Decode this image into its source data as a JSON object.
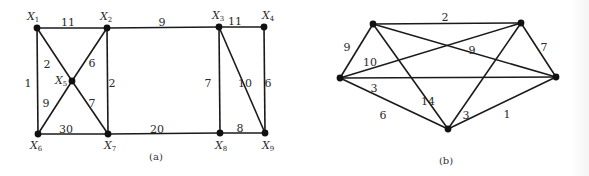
{
  "colors": {
    "edge": "#1a1a1a",
    "node": "#111111",
    "text": "#2a2a2a",
    "background": "#ffffff"
  },
  "graphs": [
    {
      "id": "a",
      "caption": "(a)",
      "caption_pos": [
        156,
        160
      ],
      "nodes": [
        {
          "id": "X1",
          "base": "X",
          "sub": "1",
          "x": 37,
          "y": 28,
          "lx": 27,
          "ly": 20
        },
        {
          "id": "X2",
          "base": "X",
          "sub": "2",
          "x": 107,
          "y": 28,
          "lx": 100,
          "ly": 20
        },
        {
          "id": "X3",
          "base": "X",
          "sub": "3",
          "x": 219,
          "y": 27,
          "lx": 212,
          "ly": 19
        },
        {
          "id": "X4",
          "base": "X",
          "sub": "4",
          "x": 264,
          "y": 27,
          "lx": 262,
          "ly": 19
        },
        {
          "id": "X5",
          "base": "X",
          "sub": "5",
          "x": 72,
          "y": 81,
          "lx": 55,
          "ly": 84
        },
        {
          "id": "X6",
          "base": "X",
          "sub": "6",
          "x": 38,
          "y": 134,
          "lx": 30,
          "ly": 149
        },
        {
          "id": "X7",
          "base": "X",
          "sub": "7",
          "x": 108,
          "y": 134,
          "lx": 104,
          "ly": 149
        },
        {
          "id": "X8",
          "base": "X",
          "sub": "8",
          "x": 220,
          "y": 133,
          "lx": 215,
          "ly": 149
        },
        {
          "id": "X9",
          "base": "X",
          "sub": "9",
          "x": 265,
          "y": 133,
          "lx": 262,
          "ly": 149
        }
      ],
      "edges": [
        {
          "from": "X1",
          "to": "X2",
          "w": "11",
          "lx": 68,
          "ly": 23
        },
        {
          "from": "X2",
          "to": "X3",
          "w": "9",
          "lx": 162,
          "ly": 23
        },
        {
          "from": "X3",
          "to": "X4",
          "w": "11",
          "lx": 235,
          "ly": 22
        },
        {
          "from": "X1",
          "to": "X6",
          "w": "1",
          "lx": 28,
          "ly": 84
        },
        {
          "from": "X1",
          "to": "X5",
          "w": "2",
          "lx": 47,
          "ly": 65
        },
        {
          "from": "X2",
          "to": "X5",
          "w": "6",
          "lx": 92,
          "ly": 64
        },
        {
          "from": "X2",
          "to": "X7",
          "w": "2",
          "lx": 112,
          "ly": 84
        },
        {
          "from": "X5",
          "to": "X6",
          "w": "9",
          "lx": 46,
          "ly": 104
        },
        {
          "from": "X5",
          "to": "X7",
          "w": "7",
          "lx": 92,
          "ly": 104
        },
        {
          "from": "X6",
          "to": "X7",
          "w": "30",
          "lx": 66,
          "ly": 130
        },
        {
          "from": "X7",
          "to": "X8",
          "w": "20",
          "lx": 157,
          "ly": 130
        },
        {
          "from": "X3",
          "to": "X8",
          "w": "7",
          "lx": 208,
          "ly": 84
        },
        {
          "from": "X3",
          "to": "X9",
          "w": "10",
          "lx": 245,
          "ly": 84
        },
        {
          "from": "X4",
          "to": "X9",
          "w": "6",
          "lx": 268,
          "ly": 84
        },
        {
          "from": "X8",
          "to": "X9",
          "w": "8",
          "lx": 240,
          "ly": 129
        }
      ]
    },
    {
      "id": "b",
      "caption": "(b)",
      "caption_pos": [
        446,
        164
      ],
      "nodes": [
        {
          "id": "A",
          "base": "",
          "sub": "",
          "x": 340,
          "y": 78
        },
        {
          "id": "B",
          "base": "",
          "sub": "",
          "x": 373,
          "y": 24
        },
        {
          "id": "C",
          "base": "",
          "sub": "",
          "x": 521,
          "y": 23
        },
        {
          "id": "D",
          "base": "",
          "sub": "",
          "x": 556,
          "y": 77
        },
        {
          "id": "E",
          "base": "",
          "sub": "",
          "x": 448,
          "y": 129
        }
      ],
      "edges": [
        {
          "from": "B",
          "to": "C",
          "w": "2",
          "lx": 445,
          "ly": 18
        },
        {
          "from": "A",
          "to": "B",
          "w": "9",
          "lx": 347,
          "ly": 48
        },
        {
          "from": "C",
          "to": "D",
          "w": "7",
          "lx": 544,
          "ly": 48
        },
        {
          "from": "A",
          "to": "C",
          "w": "10",
          "lx": 370,
          "ly": 63
        },
        {
          "from": "B",
          "to": "D",
          "w": "9",
          "lx": 472,
          "ly": 51
        },
        {
          "from": "A",
          "to": "D",
          "w": "3",
          "lx": 374,
          "ly": 89
        },
        {
          "from": "B",
          "to": "E",
          "w": "14",
          "lx": 428,
          "ly": 102
        },
        {
          "from": "A",
          "to": "E",
          "w": "6",
          "lx": 383,
          "ly": 116
        },
        {
          "from": "C",
          "to": "E",
          "w": "3",
          "lx": 466,
          "ly": 116
        },
        {
          "from": "D",
          "to": "E",
          "w": "1",
          "lx": 507,
          "ly": 115
        }
      ]
    }
  ]
}
